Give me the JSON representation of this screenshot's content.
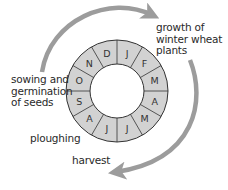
{
  "diagram": {
    "type": "cycle",
    "colors": {
      "ring_fill": "#d2d2d2",
      "ring_stroke": "#333333",
      "arrow": "#9c9c9c",
      "text": "#2a2a2a"
    },
    "months": [
      "J",
      "F",
      "M",
      "A",
      "M",
      "J",
      "J",
      "A",
      "S",
      "O",
      "N",
      "D"
    ],
    "labels": {
      "growth": [
        "growth of",
        "winter wheat",
        "plants"
      ],
      "sowing": [
        "sowing and",
        "germination",
        "of seeds"
      ],
      "ploughing": "ploughing",
      "harvest": "harvest"
    },
    "arrows": [
      {
        "name": "arrow-sowing-to-growth",
        "from": "sowing and germination of seeds",
        "to": "growth of winter wheat plants"
      },
      {
        "name": "arrow-growth-to-harvest",
        "from": "growth of winter wheat plants",
        "to": "harvest"
      }
    ]
  }
}
